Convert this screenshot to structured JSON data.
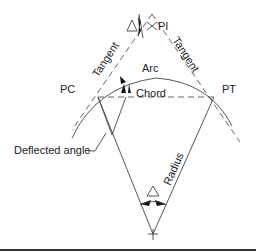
{
  "diagram": {
    "labels": {
      "pi": "PI",
      "pc": "PC",
      "pt": "PT",
      "tangent_left": "Tangent",
      "tangent_right": "Tangent",
      "arc": "Arc",
      "chord": "Chord",
      "deflected_angle": "Deflected angle",
      "radius": "Radius",
      "delta_symbol": "Δ"
    },
    "colors": {
      "line": "#444444",
      "text": "#222222",
      "background": "#ffffff",
      "bottom_rule": "#333333"
    }
  }
}
